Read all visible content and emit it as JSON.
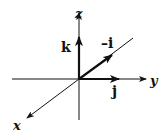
{
  "diagram": {
    "title": "",
    "origin": [
      79,
      79
    ],
    "axes": {
      "x": {
        "label": "x"
      },
      "y": {
        "label": "y"
      },
      "z": {
        "label": "z"
      }
    },
    "vectors": {
      "k": {
        "label": "k"
      },
      "neg_i": {
        "label": "–i"
      },
      "j": {
        "label": "j"
      }
    },
    "colors": {
      "ink": "#111111",
      "background": "#ffffff"
    }
  }
}
